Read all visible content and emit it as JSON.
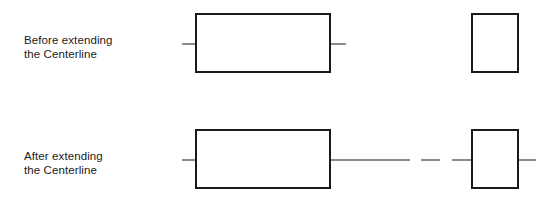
{
  "diagram": {
    "background_color": "#ffffff",
    "outline_color": "#1a1a1a",
    "centerline_color": "#8b8b8b",
    "width": 555,
    "height": 206
  },
  "rows": [
    {
      "id": "before",
      "caption": "Before extending\nthe Centerline",
      "caption_line1": "Before extending",
      "caption_line2": "the Centerline",
      "centerline_y": 44,
      "shapes": [
        {
          "name": "rectangle",
          "x": 196,
          "y": 14,
          "width": 134,
          "height": 58
        },
        {
          "name": "square",
          "x": 472,
          "y": 14,
          "width": 46,
          "height": 58
        }
      ],
      "centerline_segments": [
        {
          "x1": 182,
          "x2": 251
        },
        {
          "x1": 262,
          "x2": 279
        },
        {
          "x1": 291,
          "x2": 346
        }
      ],
      "square_has_centerline": false
    },
    {
      "id": "after",
      "caption": "After extending\nthe Centerline",
      "caption_line1": "After extending",
      "caption_line2": "the Centerline",
      "centerline_y": 160,
      "shapes": [
        {
          "name": "rectangle",
          "x": 196,
          "y": 130,
          "width": 134,
          "height": 58
        },
        {
          "name": "square",
          "x": 472,
          "y": 130,
          "width": 46,
          "height": 58
        }
      ],
      "centerline_segments": [
        {
          "x1": 182,
          "x2": 251
        },
        {
          "x1": 262,
          "x2": 279
        },
        {
          "x1": 291,
          "x2": 410
        },
        {
          "x1": 421,
          "x2": 440
        },
        {
          "x1": 452,
          "x2": 536
        }
      ],
      "square_has_centerline": true
    }
  ]
}
